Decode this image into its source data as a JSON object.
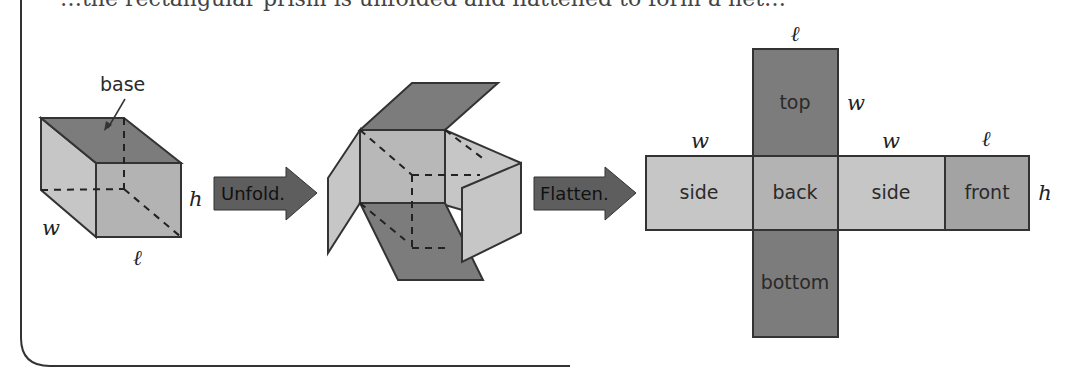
{
  "header": {
    "clipped_text": "…the rectangular prism is unfolded and flattened to form a net…"
  },
  "prism": {
    "base_label": "base",
    "dims": {
      "width": "w",
      "height": "h",
      "length": "ℓ"
    }
  },
  "arrows": [
    {
      "label": "Unfold."
    },
    {
      "label": "Flatten."
    }
  ],
  "net": {
    "faces": [
      {
        "id": "top",
        "label": "top"
      },
      {
        "id": "side-left",
        "label": "side"
      },
      {
        "id": "back",
        "label": "back"
      },
      {
        "id": "side-right",
        "label": "side"
      },
      {
        "id": "front",
        "label": "front"
      },
      {
        "id": "bottom",
        "label": "bottom"
      }
    ],
    "dims": {
      "top_width": "ℓ",
      "top_height": "w",
      "side_left_width": "w",
      "side_right_width": "w",
      "front_width": "ℓ",
      "row_height": "h"
    }
  },
  "colors": {
    "dark_face": "#7a7a7a",
    "mid_face": "#a9a9a9",
    "light_face": "#c9c9c9",
    "outline": "#3a3a3a",
    "arrow": "#555555"
  }
}
